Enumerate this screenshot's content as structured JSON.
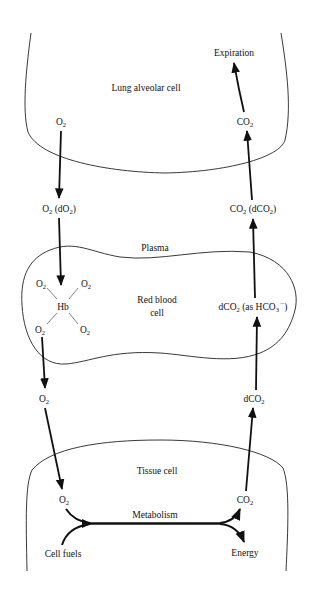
{
  "diagram": {
    "title": "",
    "compartments": {
      "lung": {
        "label": "Lung alveolar cell"
      },
      "plasma": {
        "label": "Plasma"
      },
      "rbc": {
        "label_line1": "Red blood",
        "label_line2": "cell"
      },
      "tissue": {
        "label": "Tissue cell"
      }
    },
    "left_column": {
      "lung_o2": {
        "base": "O",
        "sub": "2"
      },
      "plasma_o2": {
        "base": "O",
        "sub": "2",
        "paren_open": " (dO",
        "paren_sub": "2",
        "paren_close": ")"
      },
      "hb": {
        "center": "Hb",
        "ligand_base": "O",
        "ligand_sub": "2"
      },
      "blood_o2": {
        "base": "O",
        "sub": "2"
      },
      "tissue_o2": {
        "base": "O",
        "sub": "2"
      }
    },
    "right_column": {
      "expiration": "Expiration",
      "lung_co2": {
        "base": "CO",
        "sub": "2"
      },
      "plasma_co2": {
        "base": "CO",
        "sub": "2",
        "paren_open": " (dCO",
        "paren_sub": "2",
        "paren_close": ")"
      },
      "rbc_dco2": {
        "base": "dCO",
        "sub": "2",
        "mid": " (as HCO",
        "mid_sub": "3",
        "sup": " −",
        "close": ")"
      },
      "blood_dco2": {
        "base": "dCO",
        "sub": "2"
      },
      "tissue_co2": {
        "base": "CO",
        "sub": "2"
      }
    },
    "metabolism": {
      "label": "Metabolism",
      "input": "Cell fuels",
      "output": "Energy"
    }
  }
}
